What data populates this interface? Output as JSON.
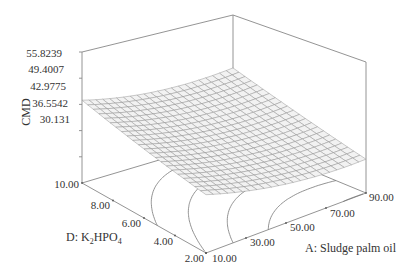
{
  "chart_data": {
    "type": "surface3d",
    "title": "",
    "z_axis": {
      "label": "CMD",
      "ticks": [
        "55.8239",
        "49.4007",
        "42.9775",
        "36.5542",
        "30.131"
      ],
      "range": [
        23.7078,
        55.8239
      ]
    },
    "x_axis": {
      "label": "A: Sludge palm oil",
      "ticks": [
        "10.00",
        "30.00",
        "50.00",
        "70.00",
        "90.00"
      ],
      "range": [
        10,
        90
      ]
    },
    "y_axis": {
      "label_prefix": "D: K",
      "label_sub1": "2",
      "label_mid": "HPO",
      "label_sub2": "4",
      "ticks": [
        "2.00",
        "4.00",
        "6.00",
        "8.00",
        "10.00"
      ],
      "range": [
        2,
        10
      ]
    },
    "surface_samples": [
      {
        "A": 10,
        "D": 10,
        "CMD": 44.0
      },
      {
        "A": 10,
        "D": 2,
        "CMD": 38.5
      },
      {
        "A": 90,
        "D": 10,
        "CMD": 41.5
      },
      {
        "A": 90,
        "D": 2,
        "CMD": 29.5
      },
      {
        "A": 60,
        "D": 6,
        "CMD": 27.0
      }
    ],
    "contour_floor": true,
    "grid": false
  },
  "colors": {
    "box": "#888888",
    "mesh_line": "#8a8a8a",
    "mesh_fill": "#f2f2f2",
    "contour": "#777777",
    "text": "#333333"
  }
}
